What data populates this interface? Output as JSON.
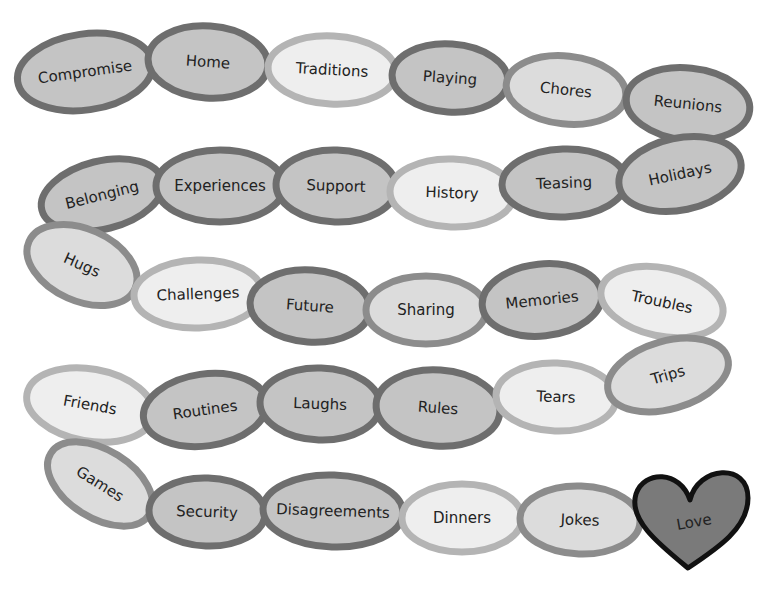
{
  "diagram": {
    "type": "paper-chain",
    "tones": {
      "dark": {
        "fill": "#c4c4c4",
        "stroke": "#6e6e6e"
      },
      "medium": {
        "fill": "#dcdcdc",
        "stroke": "#8c8c8c"
      },
      "light": {
        "fill": "#eeeeee",
        "stroke": "#b4b4b4"
      }
    },
    "links": [
      {
        "label": "Compromise",
        "cx": 85,
        "cy": 72,
        "rx": 68,
        "ry": 38,
        "rot": -8,
        "tone": "dark"
      },
      {
        "label": "Home",
        "cx": 208,
        "cy": 62,
        "rx": 60,
        "ry": 36,
        "rot": 4,
        "tone": "dark"
      },
      {
        "label": "Traditions",
        "cx": 332,
        "cy": 70,
        "rx": 64,
        "ry": 34,
        "rot": 3,
        "tone": "light"
      },
      {
        "label": "Playing",
        "cx": 450,
        "cy": 78,
        "rx": 58,
        "ry": 34,
        "rot": 4,
        "tone": "dark"
      },
      {
        "label": "Chores",
        "cx": 566,
        "cy": 90,
        "rx": 60,
        "ry": 34,
        "rot": 6,
        "tone": "medium"
      },
      {
        "label": "Reunions",
        "cx": 688,
        "cy": 104,
        "rx": 62,
        "ry": 36,
        "rot": 6,
        "tone": "dark"
      },
      {
        "label": "Belonging",
        "cx": 102,
        "cy": 195,
        "rx": 62,
        "ry": 34,
        "rot": -14,
        "tone": "dark"
      },
      {
        "label": "Experiences",
        "cx": 220,
        "cy": 186,
        "rx": 64,
        "ry": 36,
        "rot": 0,
        "tone": "dark"
      },
      {
        "label": "Support",
        "cx": 336,
        "cy": 186,
        "rx": 60,
        "ry": 36,
        "rot": 2,
        "tone": "dark"
      },
      {
        "label": "History",
        "cx": 452,
        "cy": 193,
        "rx": 62,
        "ry": 34,
        "rot": 2,
        "tone": "light"
      },
      {
        "label": "Teasing",
        "cx": 564,
        "cy": 183,
        "rx": 62,
        "ry": 34,
        "rot": -2,
        "tone": "dark"
      },
      {
        "label": "Holidays",
        "cx": 680,
        "cy": 174,
        "rx": 62,
        "ry": 36,
        "rot": -12,
        "tone": "dark"
      },
      {
        "label": "Hugs",
        "cx": 82,
        "cy": 265,
        "rx": 58,
        "ry": 36,
        "rot": 24,
        "tone": "medium"
      },
      {
        "label": "Challenges",
        "cx": 198,
        "cy": 294,
        "rx": 64,
        "ry": 34,
        "rot": -2,
        "tone": "light"
      },
      {
        "label": "Future",
        "cx": 310,
        "cy": 306,
        "rx": 60,
        "ry": 36,
        "rot": 4,
        "tone": "dark"
      },
      {
        "label": "Sharing",
        "cx": 426,
        "cy": 310,
        "rx": 60,
        "ry": 34,
        "rot": 0,
        "tone": "medium"
      },
      {
        "label": "Memories",
        "cx": 542,
        "cy": 300,
        "rx": 60,
        "ry": 36,
        "rot": -6,
        "tone": "dark"
      },
      {
        "label": "Troubles",
        "cx": 662,
        "cy": 302,
        "rx": 62,
        "ry": 34,
        "rot": 12,
        "tone": "light"
      },
      {
        "label": "Friends",
        "cx": 90,
        "cy": 405,
        "rx": 64,
        "ry": 36,
        "rot": 10,
        "tone": "light"
      },
      {
        "label": "Routines",
        "cx": 205,
        "cy": 410,
        "rx": 62,
        "ry": 36,
        "rot": -8,
        "tone": "dark"
      },
      {
        "label": "Laughs",
        "cx": 320,
        "cy": 404,
        "rx": 60,
        "ry": 36,
        "rot": 2,
        "tone": "dark"
      },
      {
        "label": "Rules",
        "cx": 438,
        "cy": 408,
        "rx": 62,
        "ry": 38,
        "rot": 4,
        "tone": "dark"
      },
      {
        "label": "Tears",
        "cx": 556,
        "cy": 397,
        "rx": 60,
        "ry": 34,
        "rot": 2,
        "tone": "light"
      },
      {
        "label": "Trips",
        "cx": 668,
        "cy": 375,
        "rx": 62,
        "ry": 34,
        "rot": -16,
        "tone": "medium"
      },
      {
        "label": "Games",
        "cx": 100,
        "cy": 484,
        "rx": 58,
        "ry": 34,
        "rot": 32,
        "tone": "medium"
      },
      {
        "label": "Security",
        "cx": 207,
        "cy": 512,
        "rx": 58,
        "ry": 34,
        "rot": 2,
        "tone": "dark"
      },
      {
        "label": "Disagreements",
        "cx": 333,
        "cy": 511,
        "rx": 70,
        "ry": 36,
        "rot": 2,
        "tone": "dark"
      },
      {
        "label": "Dinners",
        "cx": 462,
        "cy": 518,
        "rx": 60,
        "ry": 34,
        "rot": 0,
        "tone": "light"
      },
      {
        "label": "Jokes",
        "cx": 580,
        "cy": 520,
        "rx": 60,
        "ry": 34,
        "rot": 2,
        "tone": "medium"
      }
    ],
    "end": {
      "label": "Love",
      "shape": "heart",
      "fill": "#7a7a7a",
      "stroke": "#111111"
    }
  }
}
